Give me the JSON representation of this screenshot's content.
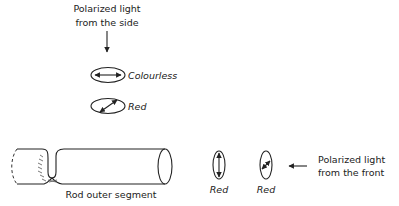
{
  "side_light": {
    "label_line1": "Polarized light",
    "label_line2": "from the side",
    "arrow_icon": "down-arrow-icon"
  },
  "side_views": [
    {
      "orientation": "horizontal",
      "label": "Colourless"
    },
    {
      "orientation": "diagonal",
      "label": "Red"
    }
  ],
  "rod": {
    "label": "Rod outer segment"
  },
  "front_views": [
    {
      "orientation": "vertical",
      "label": "Red"
    },
    {
      "orientation": "diagonal",
      "label": "Red"
    }
  ],
  "front_light": {
    "label_line1": "Polarized light",
    "label_line2": "from the front",
    "arrow_icon": "left-arrow-icon"
  }
}
